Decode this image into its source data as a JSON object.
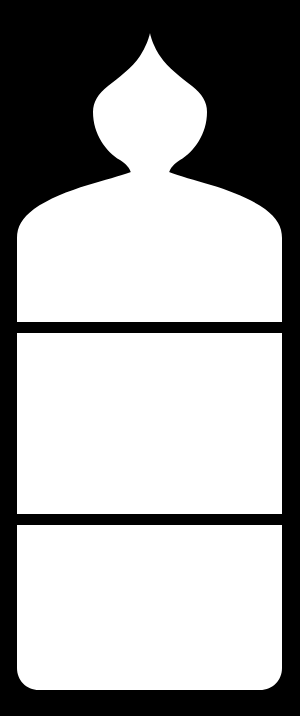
{
  "canvas": {
    "width": 300,
    "height": 716,
    "background_color": "#000000",
    "foreground_color": "#ffffff",
    "title": "Silhouette Figure Graphic"
  },
  "artifact": {
    "top_edge_text": "o o o"
  },
  "figure": {
    "name": "bulb-headed figure silhouette",
    "fill_color": "#ffffff",
    "head": {
      "label": "onion-dome head",
      "apex_x": 150,
      "apex_y": 33,
      "widest_y": 108,
      "left_extent_x": 95,
      "right_extent_x": 207
    },
    "neck": {
      "label": "neck",
      "narrowest_y": 165,
      "left_x": 117,
      "right_x": 183
    },
    "body": {
      "label": "torso block",
      "left_x": 17,
      "right_x": 282,
      "shoulder_top_y": 172,
      "full_width_y": 215,
      "bottom_y": 690,
      "bottom_corner_radius": 22
    },
    "dividers": [
      {
        "label": "upper divider band",
        "top_y": 322,
        "bottom_y": 333,
        "thickness": 11,
        "color": "#000000"
      },
      {
        "label": "lower divider band",
        "top_y": 514,
        "bottom_y": 525,
        "thickness": 11,
        "color": "#000000"
      }
    ],
    "panels": [
      {
        "label": "upper torso panel",
        "top_y": 172,
        "bottom_y": 322
      },
      {
        "label": "middle torso panel",
        "top_y": 333,
        "bottom_y": 514
      },
      {
        "label": "lower torso panel",
        "top_y": 525,
        "bottom_y": 690
      }
    ]
  }
}
